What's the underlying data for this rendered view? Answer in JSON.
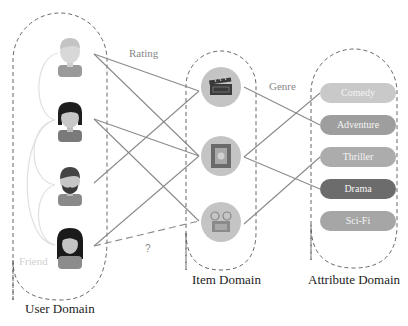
{
  "diagram": {
    "domains": {
      "user": {
        "label": "User Domain"
      },
      "item": {
        "label": "Item Domain"
      },
      "attribute": {
        "label": "Attribute Domain"
      }
    },
    "edge_labels": {
      "rating": "Rating",
      "genre": "Genre",
      "friend": "Friend",
      "unknown": "?"
    },
    "users": [
      {
        "id": "user-1",
        "icon": "user-light-hair-icon"
      },
      {
        "id": "user-2",
        "icon": "user-dark-hair-icon"
      },
      {
        "id": "user-3",
        "icon": "user-bearded-icon"
      },
      {
        "id": "user-4",
        "icon": "user-long-hair-icon"
      }
    ],
    "items": [
      {
        "id": "item-1",
        "icon": "clapperboard-icon"
      },
      {
        "id": "item-2",
        "icon": "film-strip-icon"
      },
      {
        "id": "item-3",
        "icon": "projector-icon"
      }
    ],
    "attributes": [
      {
        "label": "Comedy",
        "color": "#c9c9c9"
      },
      {
        "label": "Adventure",
        "color": "#9e9e9e"
      },
      {
        "label": "Thriller",
        "color": "#acacac"
      },
      {
        "label": "Drama",
        "color": "#6c6c6c"
      },
      {
        "label": "Sci-Fi",
        "color": "#a6a6a6"
      }
    ],
    "rating_edges": [
      {
        "from": "user-1",
        "to": "item-1"
      },
      {
        "from": "user-1",
        "to": "item-2"
      },
      {
        "from": "user-2",
        "to": "item-2"
      },
      {
        "from": "user-2",
        "to": "item-3"
      },
      {
        "from": "user-3",
        "to": "item-1"
      },
      {
        "from": "user-4",
        "to": "item-2"
      },
      {
        "from": "user-4",
        "to": "item-3",
        "style": "dashed",
        "label": "?"
      }
    ],
    "genre_edges": [
      {
        "from": "item-1",
        "to": "Adventure"
      },
      {
        "from": "item-2",
        "to": "Comedy"
      },
      {
        "from": "item-2",
        "to": "Drama"
      },
      {
        "from": "item-3",
        "to": "Thriller"
      }
    ],
    "friend_edges": [
      {
        "from": "user-1",
        "to": "user-2"
      },
      {
        "from": "user-2",
        "to": "user-3"
      },
      {
        "from": "user-2",
        "to": "user-4"
      },
      {
        "from": "user-3",
        "to": "user-4"
      }
    ],
    "colors": {
      "edge": "#8a8a8a",
      "friend_edge": "#dedede",
      "domain_border": "#555555",
      "item_circle": "#c4c4c4"
    }
  }
}
